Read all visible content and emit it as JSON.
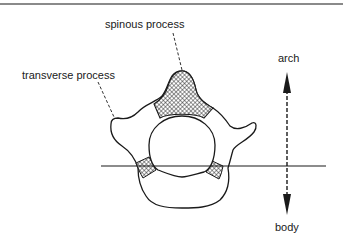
{
  "diagram": {
    "labels": {
      "spinous_process": "spinous process",
      "transverse_process": "transverse process",
      "arch": "arch",
      "body": "body"
    },
    "colors": {
      "line": "#1a1a1a",
      "hatch": "#1a1a1a",
      "background": "#ffffff",
      "top_rule": "#8a8a8a"
    },
    "regions": [
      {
        "name": "spinous-process",
        "style": "cross-hatched"
      },
      {
        "name": "left-pedicle",
        "style": "cross-hatched"
      },
      {
        "name": "right-pedicle",
        "style": "cross-hatched"
      },
      {
        "name": "vertebral-foramen",
        "style": "open"
      },
      {
        "name": "vertebral-body",
        "style": "open"
      },
      {
        "name": "transverse-processes",
        "style": "open"
      }
    ],
    "annotations": {
      "divider": "horizontal line separating arch (above) from body (below)",
      "axis_arrow": "dashed double-headed vertical arrow: up to arch, down to body"
    }
  }
}
